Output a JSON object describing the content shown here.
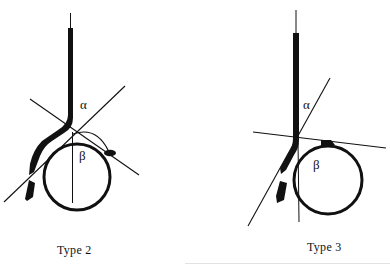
{
  "figure": {
    "panels": [
      {
        "id": "type-2",
        "caption": "Type 2",
        "angle_labels": {
          "alpha": "α",
          "beta": "β"
        }
      },
      {
        "id": "type-3",
        "caption": "Type 3",
        "angle_labels": {
          "alpha": "α",
          "beta": "β"
        }
      }
    ],
    "colors": {
      "ink": "#111111",
      "background": "#ffffff"
    }
  }
}
